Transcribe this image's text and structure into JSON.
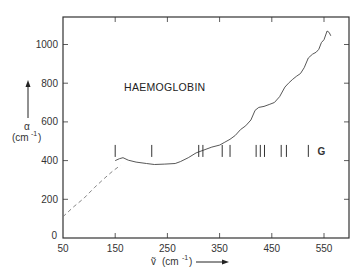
{
  "chart_data": {
    "type": "line",
    "title": "",
    "annotation": "HAEMOGLOBIN",
    "xlabel": "ṽ (cm⁻¹)",
    "ylabel": "α (cm⁻¹)",
    "xlim": [
      50,
      600
    ],
    "ylim": [
      0,
      1150
    ],
    "x_ticks": [
      50,
      150,
      250,
      350,
      450,
      550
    ],
    "y_ticks": [
      0,
      200,
      400,
      600,
      800,
      1000
    ],
    "grid": false,
    "legend": null,
    "series": [
      {
        "name": "measured",
        "style": "solid",
        "points": [
          [
            150,
            400
          ],
          [
            158,
            410
          ],
          [
            165,
            415
          ],
          [
            175,
            402
          ],
          [
            190,
            392
          ],
          [
            210,
            385
          ],
          [
            225,
            380
          ],
          [
            245,
            382
          ],
          [
            265,
            385
          ],
          [
            275,
            395
          ],
          [
            290,
            415
          ],
          [
            305,
            440
          ],
          [
            320,
            455
          ],
          [
            335,
            470
          ],
          [
            350,
            480
          ],
          [
            360,
            495
          ],
          [
            370,
            510
          ],
          [
            380,
            530
          ],
          [
            390,
            560
          ],
          [
            400,
            580
          ],
          [
            410,
            610
          ],
          [
            418,
            660
          ],
          [
            425,
            675
          ],
          [
            435,
            680
          ],
          [
            445,
            690
          ],
          [
            455,
            700
          ],
          [
            465,
            730
          ],
          [
            475,
            780
          ],
          [
            482,
            800
          ],
          [
            490,
            820
          ],
          [
            497,
            835
          ],
          [
            505,
            850
          ],
          [
            512,
            880
          ],
          [
            520,
            930
          ],
          [
            528,
            950
          ],
          [
            535,
            960
          ],
          [
            540,
            975
          ],
          [
            545,
            1010
          ],
          [
            550,
            1025
          ],
          [
            556,
            1070
          ],
          [
            560,
            1062
          ],
          [
            563,
            1045
          ]
        ]
      },
      {
        "name": "extrapolated",
        "style": "dashed",
        "points": [
          [
            50,
            110
          ],
          [
            70,
            160
          ],
          [
            90,
            205
          ],
          [
            110,
            260
          ],
          [
            130,
            310
          ],
          [
            145,
            345
          ],
          [
            160,
            375
          ]
        ]
      }
    ],
    "markers": {
      "y_level": 450,
      "x_positions": [
        150,
        220,
        310,
        318,
        355,
        370,
        420,
        428,
        436,
        468,
        478,
        520
      ],
      "label": "G",
      "label_x": 545
    }
  }
}
